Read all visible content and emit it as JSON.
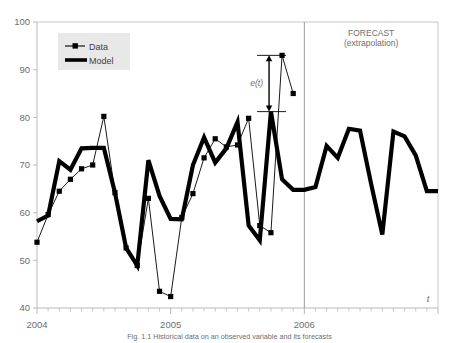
{
  "chart_data": {
    "type": "line",
    "title": "",
    "xlabel": "t",
    "ylabel": "",
    "ylim": [
      40,
      100
    ],
    "yticks": [
      40,
      50,
      60,
      70,
      80,
      90,
      100
    ],
    "xticks_labeled": [
      "2004",
      "2005",
      "2006"
    ],
    "xlim_index": [
      0,
      36
    ],
    "grid": false,
    "legend_position": "top-left",
    "series": [
      {
        "name": "Data",
        "style": "thin-line-with-square-markers",
        "x": [
          0,
          1,
          2,
          3,
          4,
          5,
          6,
          7,
          8,
          9,
          10,
          11,
          12,
          13,
          14,
          15,
          16,
          17,
          18,
          19,
          20,
          21,
          22,
          23
        ],
        "values": [
          53.8,
          59.6,
          64.5,
          67.0,
          69.2,
          70.0,
          80.2,
          64.2,
          52.6,
          48.9,
          63.0,
          43.5,
          42.4,
          59.0,
          64.0,
          71.5,
          75.5,
          73.8,
          74.2,
          79.8,
          57.3,
          55.8,
          93.0,
          85.0
        ]
      },
      {
        "name": "Model",
        "style": "thick-line",
        "x": [
          0,
          1,
          2,
          3,
          4,
          5,
          6,
          7,
          8,
          9,
          10,
          11,
          12,
          13,
          14,
          15,
          16,
          17,
          18,
          19,
          20,
          21,
          22,
          23,
          24,
          25,
          26,
          27,
          28,
          29,
          30,
          31,
          32,
          33,
          34,
          35,
          36
        ],
        "values": [
          58.2,
          59.4,
          70.8,
          69.0,
          73.5,
          73.6,
          73.6,
          64.2,
          52.6,
          48.9,
          71.0,
          63.5,
          58.7,
          58.6,
          70.0,
          75.8,
          70.5,
          73.5,
          79.0,
          57.3,
          54.2,
          81.2,
          67.0,
          64.8,
          64.8,
          65.4,
          74.0,
          71.5,
          77.6,
          77.2,
          66.0,
          55.4,
          77.0,
          76.0,
          72.0,
          64.5,
          64.5
        ]
      }
    ],
    "annotations": {
      "error_label": "e(t)",
      "error_top_value": 93.0,
      "error_bottom_value": 81.2,
      "divider_label_line1": "FORECAST",
      "divider_label_line2": "(extrapolation)",
      "divider_x_value": "2006"
    }
  },
  "legend": {
    "items": [
      {
        "label": "Data"
      },
      {
        "label": "Model"
      }
    ]
  },
  "axis": {
    "y_tick_labels": [
      "100",
      "90",
      "80",
      "70",
      "60",
      "50",
      "40"
    ],
    "x_tick_labels": [
      "2004",
      "2005",
      "2006"
    ],
    "x_axis_title": "t"
  },
  "forecast": {
    "line1": "FORECAST",
    "line2": "(extrapolation)"
  },
  "error_annotation": {
    "label": "e(t)"
  },
  "caption": {
    "text": "Fig. 1.1 Historical data on an observed variable and its forecasts"
  },
  "colors": {
    "axis": "#b9b9bb",
    "text": "#6d6e70",
    "series": "#000000",
    "legend_bg": "#e8e8e8"
  }
}
